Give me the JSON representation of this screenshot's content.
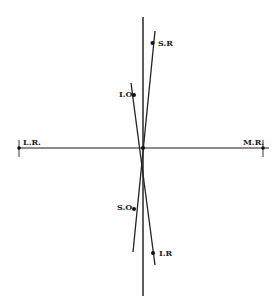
{
  "diagram": {
    "title": "",
    "labels": {
      "lateral_rectus": "L.R.",
      "medial_rectus": "M.R.",
      "superior_rectus": "S.R",
      "inferior_oblique": "I.O.",
      "superior_oblique": "S.O.",
      "inferior_rectus": "I.R"
    },
    "colors": {
      "ink": "#1a1a1a",
      "background": "#ffffff"
    }
  }
}
